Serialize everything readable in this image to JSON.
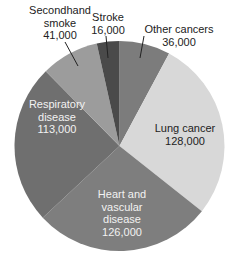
{
  "chart_data": {
    "type": "pie",
    "title": "",
    "start_angle_deg": 0,
    "direction": "clockwise",
    "total": 460000,
    "slices": [
      {
        "label": "Other cancers",
        "value": 36000,
        "value_text": "36,000",
        "color": "#7c7c7c"
      },
      {
        "label": "Lung cancer",
        "value": 128000,
        "value_text": "128,000",
        "color": "#d8d8d8"
      },
      {
        "label": "Heart and vascular disease",
        "value": 126000,
        "value_text": "126,000",
        "color": "#7e7e7e"
      },
      {
        "label": "Respiratory disease",
        "value": 113000,
        "value_text": "113,000",
        "color": "#6f6f6f"
      },
      {
        "label": "Secondhand smoke",
        "value": 41000,
        "value_text": "41,000",
        "color": "#9c9c9c"
      },
      {
        "label": "Stroke",
        "value": 16000,
        "value_text": "16,000",
        "color": "#4a4a4a"
      }
    ]
  },
  "labels": {
    "other": {
      "l1": "Other cancers",
      "l2": "36,000"
    },
    "lung": {
      "l1": "Lung cancer",
      "l2": "128,000"
    },
    "heart": {
      "l1": "Heart and",
      "l2": "vascular",
      "l3": "disease",
      "l4": "126,000"
    },
    "resp": {
      "l1": "Respiratory",
      "l2": "disease",
      "l3": "113,000"
    },
    "second": {
      "l1": "Secondhand",
      "l2": "smoke",
      "l3": "41,000"
    },
    "stroke": {
      "l1": "Stroke",
      "l2": "16,000"
    }
  }
}
